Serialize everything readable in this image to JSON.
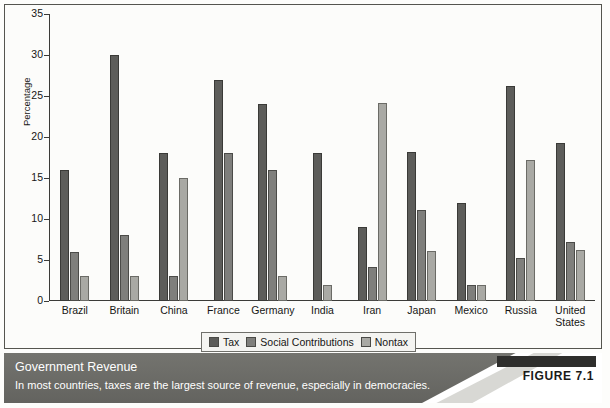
{
  "chart_data": {
    "type": "bar",
    "title": "Government Revenue",
    "subtitle": "In most countries, taxes are the largest source of revenue, especially in democracies.",
    "xlabel": "",
    "ylabel": "Percentage",
    "ylim": [
      0,
      35
    ],
    "yticks": [
      0,
      5,
      10,
      15,
      20,
      25,
      30,
      35
    ],
    "ytick_labels": [
      "0",
      "5",
      "10",
      "15",
      "20",
      "25",
      "30",
      "35"
    ],
    "grid": false,
    "legend_position": "bottom",
    "categories": [
      "Brazil",
      "Britain",
      "China",
      "France",
      "Germany",
      "India",
      "Iran",
      "Japan",
      "Mexico",
      "Russia",
      "United States"
    ],
    "series": [
      {
        "name": "Tax",
        "color": "#5d5d5a",
        "values": [
          16,
          30,
          18,
          27,
          24,
          18,
          9,
          18.2,
          12,
          26.2,
          19.3
        ]
      },
      {
        "name": "Social Contributions",
        "color": "#7f7f7c",
        "values": [
          6,
          8,
          3,
          18,
          16,
          0,
          4.2,
          11.1,
          2,
          5.2,
          7.2
        ]
      },
      {
        "name": "Nontax",
        "color": "#a9a9a4",
        "values": [
          3,
          3,
          15,
          0,
          3,
          2,
          24.2,
          6.1,
          2,
          17.2,
          6.2
        ]
      }
    ]
  },
  "figure": {
    "label": "FIGURE 7.1"
  }
}
